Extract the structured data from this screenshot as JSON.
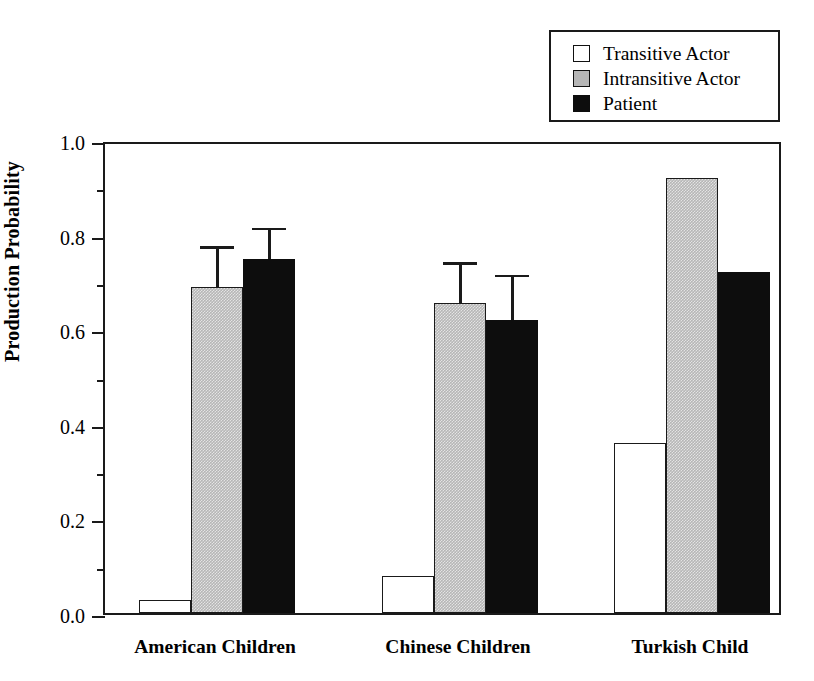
{
  "chart_data": {
    "type": "bar",
    "title": "",
    "xlabel": "",
    "ylabel": "Production Probability",
    "ylim": [
      0.0,
      1.0
    ],
    "ytick_labels": [
      "0.0",
      "0.2",
      "0.4",
      "0.6",
      "0.8",
      "1.0"
    ],
    "ytick_values": [
      0.0,
      0.2,
      0.4,
      0.6,
      0.8,
      1.0
    ],
    "yminor_values": [
      0.1,
      0.3,
      0.5,
      0.7,
      0.9
    ],
    "grid": false,
    "legend_position": "top-right",
    "categories": [
      "American Children",
      "Chinese Children",
      "Turkish Child"
    ],
    "series": [
      {
        "name": "Transitive Actor",
        "color": "#ffffff",
        "values": [
          0.028,
          0.078,
          0.36
        ],
        "errors": [
          null,
          null,
          null
        ]
      },
      {
        "name": "Intransitive Actor",
        "color": "#b6b6b6",
        "values": [
          0.69,
          0.655,
          0.92
        ],
        "errors": [
          0.085,
          0.087,
          null
        ]
      },
      {
        "name": "Patient",
        "color": "#0d0d0d",
        "values": [
          0.748,
          0.62,
          0.72
        ],
        "errors": [
          0.067,
          0.095,
          null
        ]
      }
    ]
  },
  "legend": {
    "items": [
      {
        "label": "Transitive Actor",
        "swatch": "white"
      },
      {
        "label": "Intransitive Actor",
        "swatch": "gray"
      },
      {
        "label": "Patient",
        "swatch": "black"
      }
    ]
  },
  "axis": {
    "y_title": "Production Probability",
    "y_ticks": [
      "1.0",
      "0.8",
      "0.6",
      "0.4",
      "0.2",
      "0.0"
    ],
    "x_categories": [
      "American Children",
      "Chinese Children",
      "Turkish Child"
    ]
  },
  "colors": {
    "axis": "#1a1a1a",
    "transitive_actor": "#ffffff",
    "intransitive_actor": "#b6b6b6",
    "patient": "#0d0d0d"
  }
}
